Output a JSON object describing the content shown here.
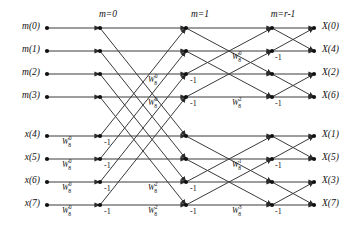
{
  "figure": {
    "width": 351,
    "height": 233,
    "line_color": "#3a3a3a",
    "node_color": "#111111",
    "text_color": "#111111",
    "background": "#ffffff"
  },
  "stage_headers": [
    {
      "text": "m=0",
      "x": 108,
      "y": 9
    },
    {
      "text": "m=1",
      "x": 200,
      "y": 9
    },
    {
      "text": "m=r-1",
      "x": 283,
      "y": 9
    }
  ],
  "inputs": [
    {
      "label": "m(0)",
      "y": 28
    },
    {
      "label": "m(1)",
      "y": 51
    },
    {
      "label": "m(2)",
      "y": 74
    },
    {
      "label": "m(3)",
      "y": 97
    },
    {
      "label": "x(4)",
      "y": 136
    },
    {
      "label": "x(5)",
      "y": 159
    },
    {
      "label": "x(6)",
      "y": 182
    },
    {
      "label": "x(7)",
      "y": 205
    }
  ],
  "outputs": [
    {
      "label": "X(0)",
      "y": 28
    },
    {
      "label": "X(4)",
      "y": 51
    },
    {
      "label": "X(2)",
      "y": 74
    },
    {
      "label": "X(6)",
      "y": 97
    },
    {
      "label": "X(1)",
      "y": 136
    },
    {
      "label": "X(5)",
      "y": 159
    },
    {
      "label": "X(3)",
      "y": 182
    },
    {
      "label": "X(7)",
      "y": 205
    }
  ],
  "weight_labels": [
    {
      "base": "W",
      "sub": "8",
      "sup": "0",
      "x": 62,
      "y": 141,
      "stage": 1
    },
    {
      "base": "W",
      "sub": "8",
      "sup": "0",
      "x": 62,
      "y": 164,
      "stage": 1
    },
    {
      "base": "W",
      "sub": "8",
      "sup": "0",
      "x": 62,
      "y": 187,
      "stage": 1
    },
    {
      "base": "W",
      "sub": "8",
      "sup": "0",
      "x": 62,
      "y": 210,
      "stage": 1
    },
    {
      "base": "W",
      "sub": "8",
      "sup": "0",
      "x": 148,
      "y": 79,
      "stage": 2
    },
    {
      "base": "W",
      "sub": "8",
      "sup": "0",
      "x": 148,
      "y": 102,
      "stage": 2
    },
    {
      "base": "W",
      "sub": "8",
      "sup": "2",
      "x": 148,
      "y": 187,
      "stage": 2
    },
    {
      "base": "W",
      "sub": "8",
      "sup": "2",
      "x": 148,
      "y": 210,
      "stage": 2
    },
    {
      "base": "W",
      "sub": "8",
      "sup": "0",
      "x": 232,
      "y": 56,
      "stage": 3
    },
    {
      "base": "W",
      "sub": "8",
      "sup": "2",
      "x": 232,
      "y": 102,
      "stage": 3
    },
    {
      "base": "W",
      "sub": "8",
      "sup": "1",
      "x": 232,
      "y": 164,
      "stage": 3
    },
    {
      "base": "W",
      "sub": "8",
      "sup": "3",
      "x": 232,
      "y": 210,
      "stage": 3
    }
  ],
  "minus_one_labels": [
    {
      "text": "-1",
      "x": 104,
      "y": 143
    },
    {
      "text": "-1",
      "x": 104,
      "y": 166
    },
    {
      "text": "-1",
      "x": 104,
      "y": 189
    },
    {
      "text": "-1",
      "x": 104,
      "y": 212
    },
    {
      "text": "-1",
      "x": 190,
      "y": 81
    },
    {
      "text": "-1",
      "x": 190,
      "y": 104
    },
    {
      "text": "-1",
      "x": 190,
      "y": 189
    },
    {
      "text": "-1",
      "x": 190,
      "y": 212
    },
    {
      "text": "-1",
      "x": 275,
      "y": 58
    },
    {
      "text": "-1",
      "x": 275,
      "y": 104
    },
    {
      "text": "-1",
      "x": 275,
      "y": 166
    },
    {
      "text": "-1",
      "x": 275,
      "y": 212
    }
  ],
  "columns": {
    "input_node_x": 47,
    "stage_node_x": [
      100,
      186,
      272
    ],
    "output_node_x": 314
  },
  "chart_data": {
    "type": "diagram",
    "diagram_kind": "signal-flow-graph",
    "name": "8-point FFT butterfly (decimation in frequency)",
    "rows": 8,
    "stages": 3,
    "row_y": [
      28,
      51,
      74,
      97,
      136,
      159,
      182,
      205
    ],
    "node_x": [
      47,
      100,
      186,
      272,
      314
    ],
    "stage1_pairs": [
      [
        0,
        4
      ],
      [
        1,
        5
      ],
      [
        2,
        6
      ],
      [
        3,
        7
      ]
    ],
    "stage2_pairs": [
      [
        0,
        2
      ],
      [
        1,
        3
      ],
      [
        4,
        6
      ],
      [
        5,
        7
      ]
    ],
    "stage3_pairs": [
      [
        0,
        1
      ],
      [
        2,
        3
      ],
      [
        4,
        5
      ],
      [
        6,
        7
      ]
    ],
    "twiddles_stage1": [
      "W80",
      "W80",
      "W80",
      "W80"
    ],
    "twiddles_stage2": [
      "W80",
      "W80",
      "W82",
      "W82"
    ],
    "twiddles_stage3": [
      "W80",
      "W82",
      "W81",
      "W83"
    ]
  }
}
